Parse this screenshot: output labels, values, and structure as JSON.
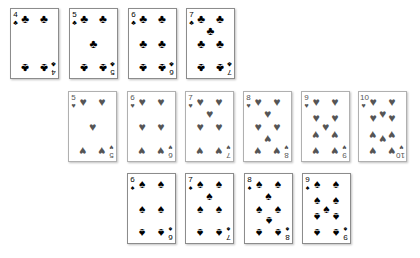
{
  "colors": {
    "clubs": "#000000",
    "spades": "#000000",
    "hearts": "#555555"
  },
  "rows": [
    {
      "name": "clubs-row",
      "suit": "clubs",
      "glyph": "♣",
      "faded": false,
      "top": 8,
      "cards": [
        {
          "rank": "4",
          "count": 4,
          "left": 10
        },
        {
          "rank": "5",
          "count": 5,
          "left": 69
        },
        {
          "rank": "6",
          "count": 6,
          "left": 128
        },
        {
          "rank": "7",
          "count": 7,
          "left": 186
        }
      ]
    },
    {
      "name": "hearts-row",
      "suit": "hearts",
      "glyph": "♥",
      "faded": true,
      "top": 91,
      "cards": [
        {
          "rank": "5",
          "count": 5,
          "left": 68
        },
        {
          "rank": "6",
          "count": 6,
          "left": 127
        },
        {
          "rank": "7",
          "count": 7,
          "left": 185
        },
        {
          "rank": "8",
          "count": 8,
          "left": 243
        },
        {
          "rank": "9",
          "count": 9,
          "left": 301
        },
        {
          "rank": "10",
          "count": 10,
          "left": 358
        }
      ]
    },
    {
      "name": "spades-row",
      "suit": "spades",
      "glyph": "♠",
      "faded": false,
      "top": 173,
      "cards": [
        {
          "rank": "6",
          "count": 6,
          "left": 127
        },
        {
          "rank": "7",
          "count": 7,
          "left": 185
        },
        {
          "rank": "8",
          "count": 8,
          "left": 244
        },
        {
          "rank": "9",
          "count": 9,
          "left": 302
        }
      ]
    }
  ]
}
